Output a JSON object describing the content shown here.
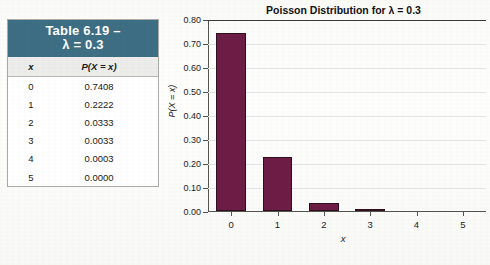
{
  "table": {
    "title_line1": "Table 6.19 –",
    "title_line2": "λ = 0.3",
    "header_x": "x",
    "header_p": "P(X = x)",
    "rows": [
      {
        "x": "0",
        "p": "0.7408"
      },
      {
        "x": "1",
        "p": "0.2222"
      },
      {
        "x": "2",
        "p": "0.0333"
      },
      {
        "x": "3",
        "p": "0.0033"
      },
      {
        "x": "4",
        "p": "0.0003"
      },
      {
        "x": "5",
        "p": "0.0000"
      }
    ],
    "header_color": "#3e6e84"
  },
  "chart_data": {
    "type": "bar",
    "title": "Poisson Distribution for λ = 0.3",
    "xlabel": "x",
    "ylabel": "P(X = x)",
    "categories": [
      "0",
      "1",
      "2",
      "3",
      "4",
      "5"
    ],
    "values": [
      0.7408,
      0.2222,
      0.0333,
      0.0033,
      0.0003,
      0.0
    ],
    "ylim": [
      0.0,
      0.8
    ],
    "ytick_labels": [
      "0.00",
      "0.10",
      "0.20",
      "0.30",
      "0.40",
      "0.50",
      "0.60",
      "0.70",
      "0.80"
    ],
    "ytick_values": [
      0.0,
      0.1,
      0.2,
      0.3,
      0.4,
      0.5,
      0.6,
      0.7,
      0.8
    ],
    "bar_color": "#6d1d45",
    "grid": true,
    "legend": "none"
  }
}
